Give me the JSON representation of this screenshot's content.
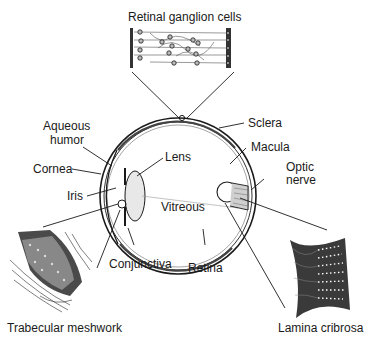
{
  "diagram": {
    "labels": {
      "retinal_ganglion_cells": "Retinal ganglion cells",
      "sclera": "Sclera",
      "aqueous_humor_line1": "Aqueous",
      "aqueous_humor_line2": "humor",
      "lens": "Lens",
      "macula": "Macula",
      "cornea": "Cornea",
      "optic_nerve_line1": "Optic",
      "optic_nerve_line2": "nerve",
      "iris": "Iris",
      "vitreous": "Vitreous",
      "conjunctiva": "Conjunctiva",
      "retina": "Retina",
      "trabecular_meshwork": "Trabecular meshwork",
      "lamina_cribrosa": "Lamina cribrosa"
    },
    "colors": {
      "ink": "#1a1a1a",
      "shade": "#555555",
      "light": "#9a9a9a",
      "background": "#ffffff"
    }
  }
}
